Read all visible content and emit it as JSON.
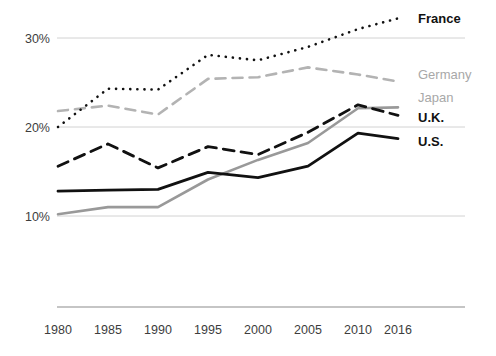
{
  "chart_data": {
    "type": "line",
    "title": "",
    "subtitle": "",
    "xlabel": "",
    "ylabel": "",
    "x": [
      1980,
      1985,
      1990,
      1995,
      2000,
      2005,
      2010,
      2016
    ],
    "tick_labels_x": [
      "1980",
      "1985",
      "1990",
      "1995",
      "2000",
      "2005",
      "2010",
      "2016"
    ],
    "tick_labels_y": [
      "10%",
      "20%",
      "30%"
    ],
    "yticks": [
      10,
      20,
      30
    ],
    "ylim": [
      8,
      33.5
    ],
    "xlim": [
      1980,
      2016
    ],
    "grid": "horizontal",
    "legend_position": "right-inline",
    "series": [
      {
        "name": "France",
        "label": "France",
        "style": "dotted",
        "color": "#111111",
        "values": [
          20.0,
          24.3,
          24.2,
          28.1,
          27.5,
          29.0,
          31.0,
          32.2
        ]
      },
      {
        "name": "Germany",
        "label": "Germany",
        "style": "dashed",
        "color": "#b3b3b3",
        "values": [
          21.8,
          22.4,
          21.4,
          25.4,
          25.6,
          26.7,
          25.9,
          25.1
        ]
      },
      {
        "name": "Japan",
        "label": "Japan",
        "style": "solid",
        "color": "#999999",
        "values": [
          10.2,
          11.0,
          11.0,
          14.1,
          16.3,
          18.2,
          22.1,
          22.2
        ]
      },
      {
        "name": "U.K.",
        "label": "U.K.",
        "style": "dashed",
        "color": "#111111",
        "values": [
          15.6,
          18.1,
          15.4,
          17.8,
          16.9,
          19.4,
          22.5,
          21.3
        ]
      },
      {
        "name": "U.S.",
        "label": "U.S.",
        "style": "solid",
        "color": "#111111",
        "values": [
          12.8,
          12.9,
          13.0,
          14.9,
          14.3,
          15.6,
          19.3,
          18.7
        ]
      }
    ]
  },
  "legend": {
    "france": "France",
    "germany": "Germany",
    "japan": "Japan",
    "uk": "U.K.",
    "us": "U.S."
  },
  "axes": {
    "y": [
      "30%",
      "20%",
      "10%"
    ],
    "x": [
      "1980",
      "1985",
      "1990",
      "1995",
      "2000",
      "2005",
      "2010",
      "2016"
    ]
  },
  "colors": {
    "dark": "#111111",
    "gray": "#b3b3b3",
    "japan_gray": "#999999",
    "grid": "#d2d2d2",
    "axis": "#8c8c8c",
    "text": "#3d3d3d",
    "background": "#ffffff"
  }
}
